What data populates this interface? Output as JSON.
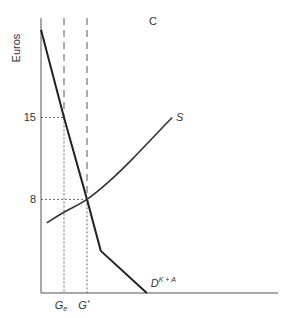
{
  "chart_data": {
    "type": "line",
    "panel_label": "C",
    "title": "",
    "ylabel": "Euros",
    "xlabel": "",
    "ylim": [
      0,
      23.5
    ],
    "xlim": [
      0,
      10
    ],
    "y_ticks": [
      {
        "value": 15,
        "label": "15"
      },
      {
        "value": 8,
        "label": "8"
      }
    ],
    "x_ticks": [
      {
        "value": 1,
        "label": "G",
        "sub": "e"
      },
      {
        "value": 2,
        "label": "G",
        "sup": "*"
      }
    ],
    "grid": false,
    "series": [
      {
        "name": "D",
        "label_base": "D",
        "label_sup": "K + A",
        "points": [
          [
            0,
            22.5
          ],
          [
            1,
            15
          ],
          [
            2,
            8
          ],
          [
            2.6,
            3.6
          ],
          [
            4.6,
            0
          ]
        ]
      },
      {
        "name": "S",
        "label_base": "S",
        "points": [
          [
            0.25,
            6
          ],
          [
            1,
            6.9
          ],
          [
            2,
            8
          ],
          [
            3,
            9.6
          ],
          [
            4,
            11.5
          ],
          [
            5.7,
            15
          ]
        ]
      }
    ],
    "guides": {
      "vertical_dashed": [
        1,
        2
      ],
      "horizontal_dotted": [
        15,
        8
      ]
    }
  }
}
